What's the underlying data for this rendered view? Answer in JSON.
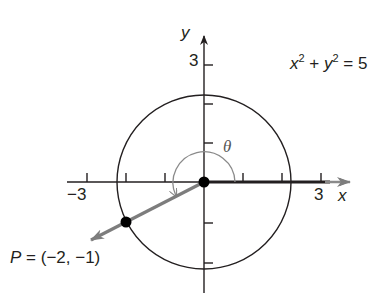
{
  "figure": {
    "type": "unit-circle-angle-diagram",
    "equation": {
      "x_term": "x",
      "y_term": "y",
      "exp": "2",
      "rhs": "5",
      "text": "x² + y² = 5"
    },
    "axes": {
      "x_label": "x",
      "y_label": "y",
      "x_tick_labels": {
        "neg": "−3",
        "pos": "3"
      },
      "y_tick_labels": {
        "pos": "3"
      },
      "x_range": [
        -3.5,
        3.8
      ],
      "y_range": [
        -3,
        3.8
      ]
    },
    "circle": {
      "center": [
        0,
        0
      ],
      "radius_squared": 5
    },
    "angle_label": "θ",
    "point": {
      "name": "P",
      "coords": [
        -2,
        -1
      ],
      "label": "P = (−2, −1)"
    },
    "colors": {
      "ink": "#231f20",
      "ray": "#808080",
      "arc": "#8a8a8a"
    }
  }
}
